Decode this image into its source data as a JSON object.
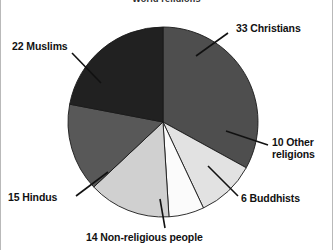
{
  "chart_data": {
    "type": "pie",
    "title": "World religions",
    "subtitle": "",
    "xlabel": "",
    "ylabel": "",
    "units": "percent",
    "legend_position": "none",
    "grid": false,
    "categories": [
      "Christians",
      "Other religions",
      "Buddhists",
      "Non-religious people",
      "Hindus",
      "Muslims"
    ],
    "values": [
      33,
      10,
      6,
      14,
      15,
      22
    ],
    "labels": [
      "33 Christians",
      "10 Other religions",
      "6 Buddhists",
      "14 Non-religious people",
      "15 Hindus",
      "22 Muslims"
    ],
    "colors": [
      "#4e4e4e",
      "#e2e2e2",
      "#fbfbfb",
      "#d0d0d0",
      "#585858",
      "#212121"
    ],
    "slices": [
      {
        "name": "Christians",
        "value": 33,
        "label": "33 Christians",
        "color": "#4e4e4e",
        "start_angle": 0.0,
        "end_angle": 118.8
      },
      {
        "name": "Other religions",
        "value": 10,
        "label": "10 Other religions",
        "color": "#e2e2e2",
        "start_angle": 118.8,
        "end_angle": 154.8
      },
      {
        "name": "Buddhists",
        "value": 6,
        "label": "6 Buddhists",
        "color": "#fbfbfb",
        "start_angle": 154.8,
        "end_angle": 176.4
      },
      {
        "name": "Non-religious people",
        "value": 14,
        "label": "14 Non-religious people",
        "color": "#d0d0d0",
        "start_angle": 176.4,
        "end_angle": 226.8
      },
      {
        "name": "Hindus",
        "value": 15,
        "label": "15 Hindus",
        "color": "#585858",
        "start_angle": 226.8,
        "end_angle": 280.8
      },
      {
        "name": "Muslims",
        "value": 22,
        "label": "22 Muslims",
        "color": "#212121",
        "start_angle": 280.8,
        "end_angle": 360.0
      }
    ],
    "total": 100,
    "center": {
      "x": 163,
      "y": 122
    },
    "radius": 95
  },
  "labels": {
    "christians": "33 Christians",
    "other_religions": "10 Other religions",
    "buddhists": "6 Buddhists",
    "non_religious": "14  Non-religious people",
    "hindus": "15 Hindus",
    "muslims": "22 Muslims"
  },
  "title": "World religions"
}
